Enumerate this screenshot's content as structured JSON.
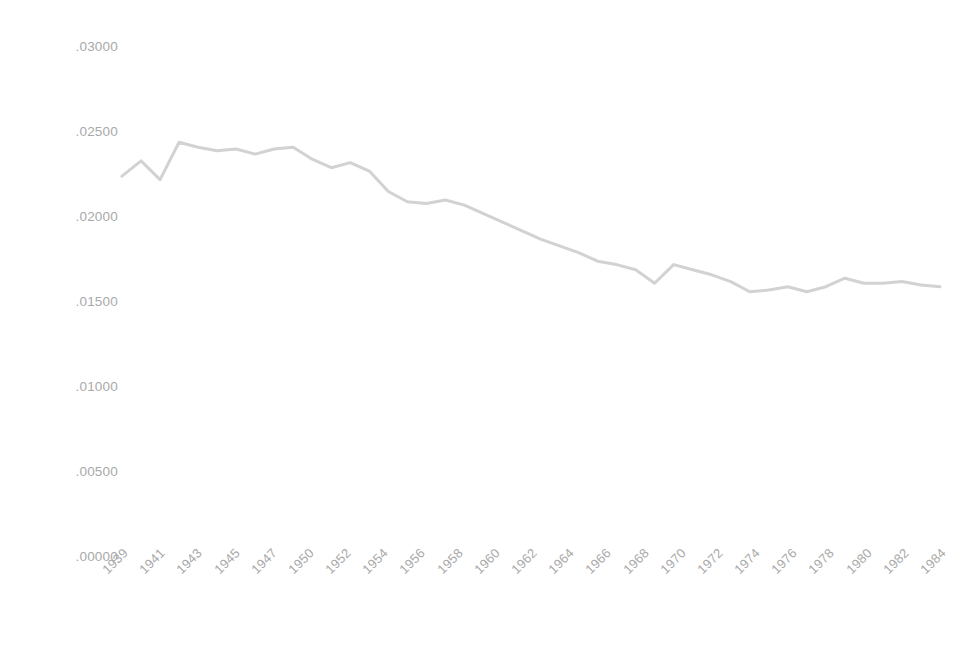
{
  "chart_data": {
    "type": "line",
    "title": "",
    "subtitle": "",
    "xlabel": "",
    "ylabel": "",
    "grid": false,
    "legend": false,
    "legend_position": "none",
    "line_color": "#d2d2d2",
    "line_width": 3,
    "axis_label_color": "#a9a9a9",
    "background_color": "#ffffff",
    "ylim": [
      0.0,
      0.03
    ],
    "ytick_values": [
      0.03,
      0.025,
      0.02,
      0.015,
      0.01,
      0.005,
      0.0
    ],
    "ytick_labels": [
      ".03000",
      ".02500",
      ".02000",
      ".01500",
      ".01000",
      ".00500",
      ".00000"
    ],
    "xtick_labels": [
      "1939",
      "1941",
      "1943",
      "1945",
      "1947",
      "1950",
      "1952",
      "1954",
      "1956",
      "1958",
      "1960",
      "1962",
      "1964",
      "1966",
      "1968",
      "1970",
      "1972",
      "1974",
      "1976",
      "1978",
      "1980",
      "1982",
      "1984"
    ],
    "categories": [
      "1939",
      "1940",
      "1941",
      "1942",
      "1943",
      "1944",
      "1945",
      "1946",
      "1947",
      "1950",
      "1951",
      "1952",
      "1953",
      "1954",
      "1955",
      "1956",
      "1957",
      "1958",
      "1959",
      "1960",
      "1961",
      "1962",
      "1963",
      "1964",
      "1965",
      "1966",
      "1967",
      "1968",
      "1969",
      "1970",
      "1971",
      "1972",
      "1973",
      "1974",
      "1975",
      "1976",
      "1977",
      "1978",
      "1979",
      "1980",
      "1981",
      "1982",
      "1983",
      "1984"
    ],
    "values": [
      0.0224,
      0.0233,
      0.0222,
      0.0244,
      0.0241,
      0.0239,
      0.024,
      0.0237,
      0.024,
      0.0241,
      0.0234,
      0.0229,
      0.0232,
      0.0227,
      0.0215,
      0.0209,
      0.0208,
      0.021,
      0.0207,
      0.0202,
      0.0197,
      0.0192,
      0.0187,
      0.0183,
      0.0179,
      0.0174,
      0.0172,
      0.0169,
      0.0161,
      0.0172,
      0.0169,
      0.0166,
      0.0162,
      0.0156,
      0.0157,
      0.0159,
      0.0156,
      0.0159,
      0.0164,
      0.0161,
      0.0161,
      0.0162,
      0.016,
      0.0159
    ],
    "annotations": []
  },
  "caption": {
    "text": ""
  }
}
